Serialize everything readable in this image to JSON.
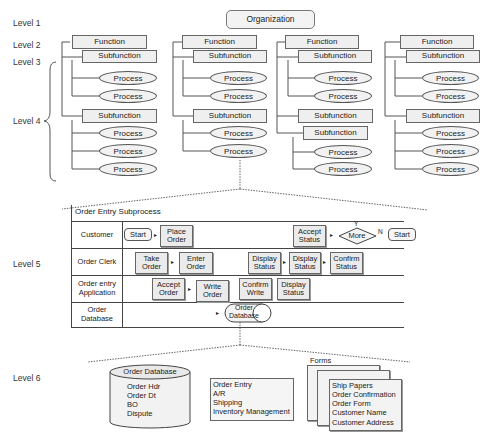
{
  "levels": [
    "Level 1",
    "Level 2",
    "Level 3",
    "Level 4",
    "Level 5",
    "Level 6"
  ],
  "hierarchy": {
    "root": "Organization",
    "columns": [
      {
        "function": "Function",
        "groups": [
          {
            "subfunction": "Subfunction",
            "processes": [
              "Process",
              "Process"
            ]
          },
          {
            "subfunction": "Subfunction",
            "processes": [
              "Process",
              "Process",
              "Process"
            ]
          }
        ]
      },
      {
        "function": "Function",
        "groups": [
          {
            "subfunction": "Subfunction",
            "processes": [
              "Process",
              "Process"
            ]
          },
          {
            "subfunction": "Subfunction",
            "processes": [
              "Process",
              "Process"
            ]
          }
        ]
      },
      {
        "function": "Function",
        "groups": [
          {
            "subfunction": "Subfunction",
            "processes": [
              "Process",
              "Process"
            ]
          },
          {
            "subfunction": "Subfunction",
            "nested_subfunction": "Subfunction",
            "processes": [
              "Process",
              "Process"
            ]
          }
        ]
      },
      {
        "function": "Function",
        "groups": [
          {
            "subfunction": "Subfunction",
            "processes": [
              "Process",
              "Process"
            ]
          },
          {
            "subfunction": "Subfunction",
            "processes": [
              "Process",
              "Process",
              "Process"
            ]
          }
        ]
      }
    ]
  },
  "swimlane": {
    "title": "Order Entry Subprocess",
    "lanes": [
      {
        "label": "Customer",
        "steps": [
          "Start",
          "Place Order",
          "Accept Status",
          "More",
          "Start"
        ],
        "decision_yes": "Y",
        "decision_no": "N"
      },
      {
        "label": "Order Clerk",
        "steps": [
          "Take Order",
          "Enter Order",
          "Display Status",
          "Display Status",
          "Confirm Status"
        ]
      },
      {
        "label": "Order entry Application",
        "steps": [
          "Accept Order",
          "Write Order",
          "Confirm Write",
          "Display Status"
        ]
      },
      {
        "label": "Order Database",
        "steps": [
          "Order Database"
        ]
      }
    ]
  },
  "level6": {
    "database": {
      "title": "Order Database",
      "items": [
        "Order Hdr",
        "Order Dt",
        "BO",
        "Dispute"
      ]
    },
    "processes": [
      "Order Entry",
      "A/R",
      "Shipping",
      "Inventory Management"
    ],
    "forms": {
      "title": "Forms",
      "items": [
        "Ship Papers",
        "Order Confirmation",
        "Order Form",
        "Customer Name",
        "Customer Address"
      ]
    }
  }
}
